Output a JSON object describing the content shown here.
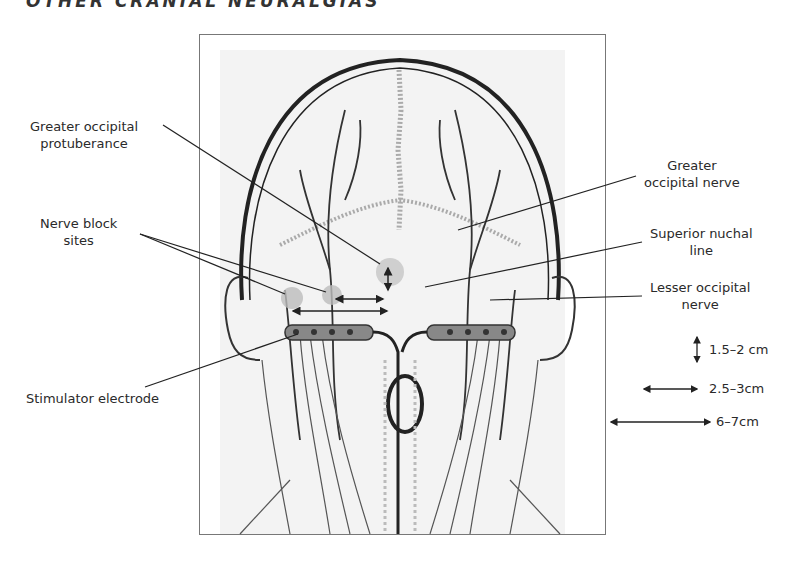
{
  "header": {
    "title": "OTHER CRANIAL NEURALGIAS"
  },
  "labels": {
    "greater_occipital_protuberance": [
      "Greater occipital",
      "protuberance"
    ],
    "nerve_block_sites": [
      "Nerve block",
      "sites"
    ],
    "stimulator_electrode": [
      "Stimulator electrode"
    ],
    "greater_occipital_nerve": [
      "Greater",
      "occipital nerve"
    ],
    "superior_nuchal_line": [
      "Superior nuchal",
      "line"
    ],
    "lesser_occipital_nerve": [
      "Lesser occipital",
      "nerve"
    ]
  },
  "scale_legend": [
    {
      "symbol": "vertical-double-arrow",
      "text": "1.5–2 cm"
    },
    {
      "symbol": "short-horizontal-double-arrow",
      "text": "2.5–3cm"
    },
    {
      "symbol": "long-horizontal-double-arrow",
      "text": "6–7cm"
    }
  ],
  "colors": {
    "ink": "#222222",
    "frame": "#777777",
    "shade": "#a8a8a8",
    "nerve": "#333333"
  }
}
